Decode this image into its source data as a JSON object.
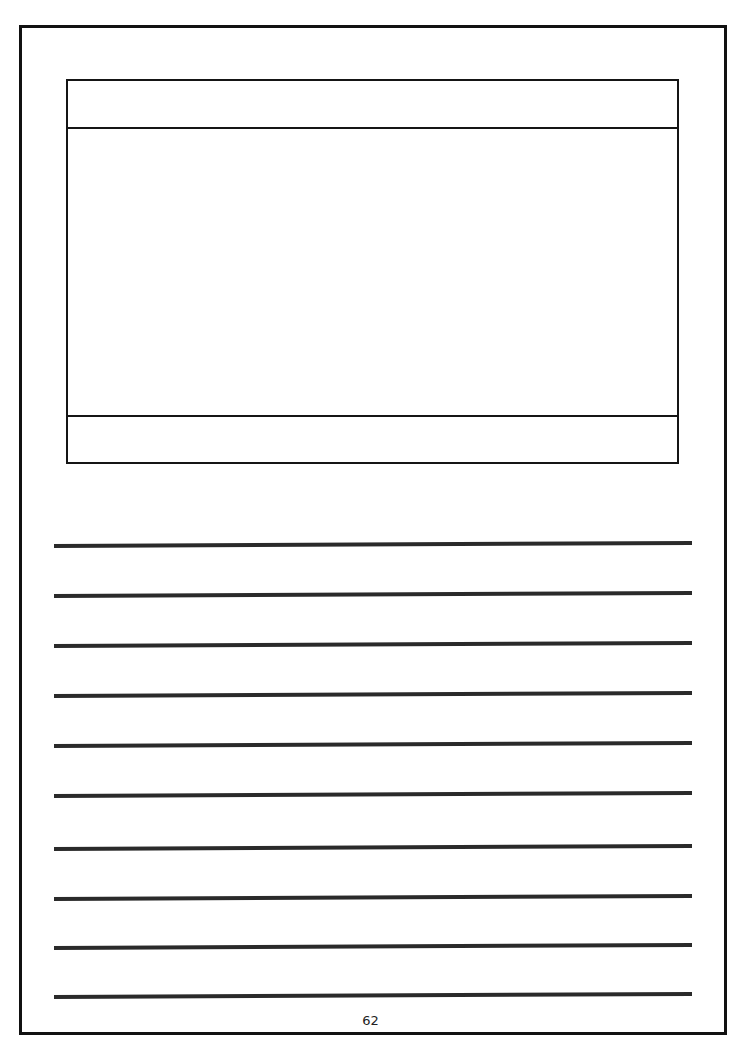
{
  "page": {
    "number": "62",
    "border_color": "#111111",
    "line_color": "#2a2a2a"
  },
  "picture_frame": {
    "header_text": "",
    "body_text": "",
    "footer_text": ""
  },
  "writing_lines": [
    {
      "top": 542,
      "text": ""
    },
    {
      "top": 592,
      "text": ""
    },
    {
      "top": 642,
      "text": ""
    },
    {
      "top": 692,
      "text": ""
    },
    {
      "top": 742,
      "text": ""
    },
    {
      "top": 792,
      "text": ""
    },
    {
      "top": 845,
      "text": ""
    },
    {
      "top": 895,
      "text": ""
    },
    {
      "top": 944,
      "text": ""
    },
    {
      "top": 993,
      "text": ""
    }
  ]
}
